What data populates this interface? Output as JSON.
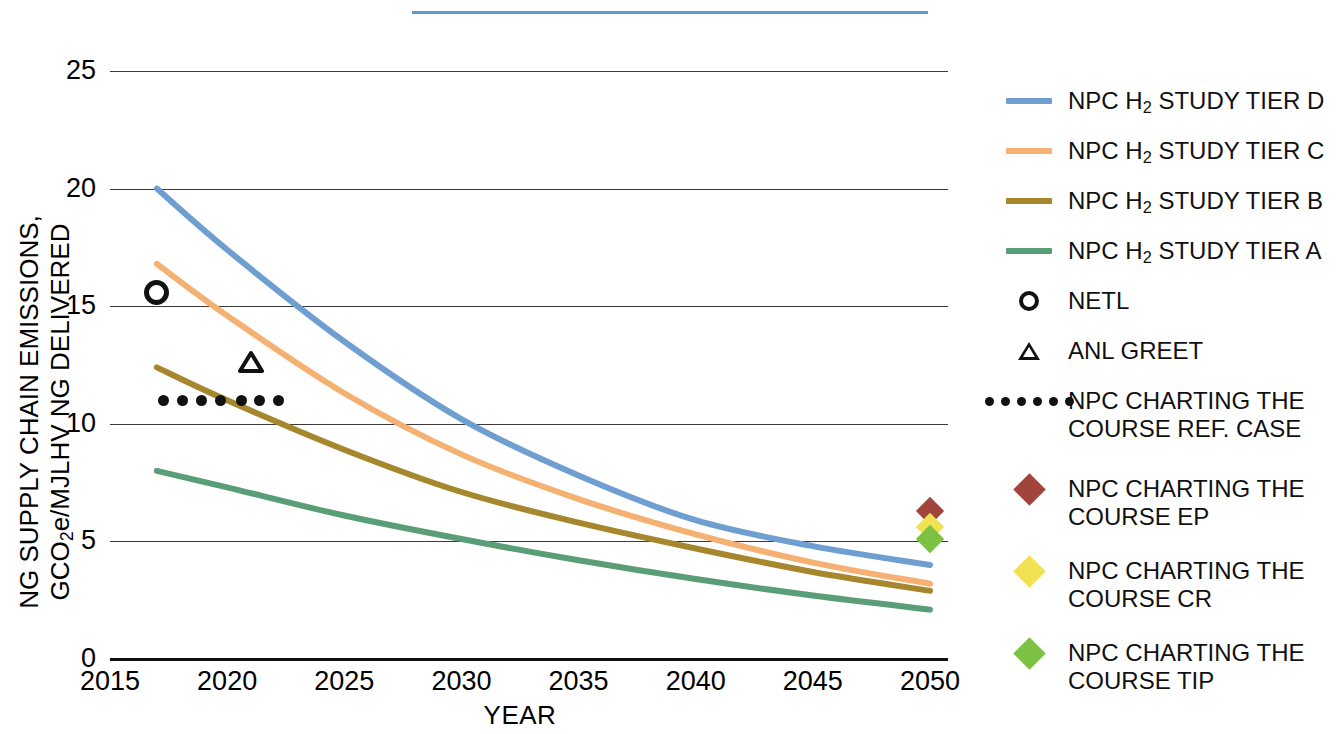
{
  "axes": {
    "y_title_line1": "NG SUPPLY CHAIN EMISSIONS,",
    "y_title_line2": "GCO2e/MJLHV NG DELIVERED",
    "x_title": "YEAR",
    "y_ticks": [
      "25",
      "20",
      "15",
      "10",
      "5",
      "0"
    ],
    "x_ticks": [
      "2015",
      "2020",
      "2025",
      "2030",
      "2035",
      "2040",
      "2045",
      "2050"
    ]
  },
  "legend": {
    "items": [
      {
        "label": "NPC H2 STUDY TIER D",
        "key": "line-swatch-blue",
        "color": "#6f9fd0"
      },
      {
        "label": "NPC H2 STUDY TIER C",
        "key": "line-swatch-orange",
        "color": "#f5b171"
      },
      {
        "label": "NPC H2 STUDY TIER B",
        "key": "line-swatch-gold",
        "color": "#a6872e"
      },
      {
        "label": "NPC H2 STUDY TIER A",
        "key": "line-swatch-green",
        "color": "#5a9e77"
      },
      {
        "label": "NETL",
        "key": "circle-marker",
        "color": "#111111"
      },
      {
        "label": "ANL GREET",
        "key": "triangle-marker",
        "color": "#111111"
      },
      {
        "label": "NPC CHARTING THE\nCOURSE REF. CASE",
        "key": "dotted-swatch",
        "color": "#111111"
      },
      {
        "label": "NPC CHARTING THE\nCOURSE EP",
        "key": "diamond-marker",
        "color": "#a0443c"
      },
      {
        "label": "NPC CHARTING THE\nCOURSE CR",
        "key": "diamond-marker",
        "color": "#f2e152"
      },
      {
        "label": "NPC CHARTING THE\nCOURSE TIP",
        "key": "diamond-marker",
        "color": "#7cc242"
      }
    ]
  },
  "chart_data": {
    "type": "line",
    "title": "",
    "xlabel": "YEAR",
    "ylabel": "NG SUPPLY CHAIN EMISSIONS, GCO2e/MJLHV NG DELIVERED",
    "xlim": [
      2015,
      2050
    ],
    "ylim": [
      0,
      26.5
    ],
    "yticks": [
      0,
      5,
      10,
      15,
      20,
      25
    ],
    "xticks": [
      2015,
      2020,
      2025,
      2030,
      2035,
      2040,
      2045,
      2050
    ],
    "grid": "horizontal",
    "legend_position": "right",
    "series": [
      {
        "name": "NPC H2 STUDY TIER D",
        "color": "#6f9fd0",
        "style": "line",
        "x": [
          2017,
          2020,
          2025,
          2030,
          2035,
          2040,
          2045,
          2050
        ],
        "values": [
          20.0,
          17.4,
          13.5,
          10.2,
          7.8,
          5.9,
          4.8,
          4.0
        ]
      },
      {
        "name": "NPC H2 STUDY TIER C",
        "color": "#f5b171",
        "style": "line",
        "x": [
          2017,
          2020,
          2025,
          2030,
          2035,
          2040,
          2045,
          2050
        ],
        "values": [
          16.8,
          14.6,
          11.3,
          8.7,
          6.8,
          5.3,
          4.1,
          3.2
        ]
      },
      {
        "name": "NPC H2 STUDY TIER B",
        "color": "#a6872e",
        "style": "line",
        "x": [
          2017,
          2020,
          2025,
          2030,
          2035,
          2040,
          2045,
          2050
        ],
        "values": [
          12.4,
          11.0,
          8.9,
          7.1,
          5.8,
          4.7,
          3.7,
          2.9
        ]
      },
      {
        "name": "NPC H2 STUDY TIER A",
        "color": "#5a9e77",
        "style": "line",
        "x": [
          2017,
          2020,
          2025,
          2030,
          2035,
          2040,
          2045,
          2050
        ],
        "values": [
          8.0,
          7.3,
          6.1,
          5.1,
          4.2,
          3.4,
          2.7,
          2.1
        ]
      },
      {
        "name": "NPC CHARTING THE COURSE REF. CASE",
        "color": "#111111",
        "style": "dotted-markers",
        "x": [
          2017.3,
          2018.1,
          2018.9,
          2019.7,
          2020.6,
          2021.4,
          2022.2
        ],
        "values": [
          11.0,
          11.0,
          11.0,
          11.0,
          11.0,
          11.0,
          11.0
        ]
      }
    ],
    "points": [
      {
        "name": "NETL",
        "marker": "circle",
        "color": "#111111",
        "x": 2017,
        "y": 15.6
      },
      {
        "name": "ANL GREET",
        "marker": "triangle",
        "color": "#111111",
        "x": 2021,
        "y": 12.6
      },
      {
        "name": "NPC CHARTING THE COURSE EP",
        "marker": "diamond",
        "color": "#a0443c",
        "x": 2050,
        "y": 6.3
      },
      {
        "name": "NPC CHARTING THE COURSE CR",
        "marker": "diamond",
        "color": "#f2e152",
        "x": 2050,
        "y": 5.6
      },
      {
        "name": "NPC CHARTING THE COURSE TIP",
        "marker": "diamond",
        "color": "#7cc242",
        "x": 2050,
        "y": 5.1
      }
    ]
  },
  "artifacts": {
    "top_rule_color": "#5b9bd5"
  }
}
